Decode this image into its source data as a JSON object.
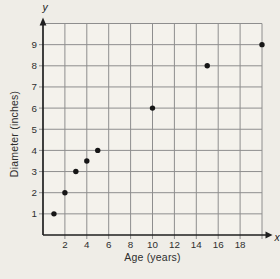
{
  "figure": {
    "background_color": "#efede7",
    "plot_area_color": "#f4f2ec",
    "grid_color": "#8e8e8e",
    "axis_color": "#1f1f1f",
    "point_color": "#161616",
    "text_color": "#2e2e2e"
  },
  "chart_data": {
    "type": "scatter",
    "title": "",
    "xlabel": "Age (years)",
    "ylabel": "Diameter (inches)",
    "x_axis_end_label": "x",
    "y_axis_end_label": "y",
    "xlim": [
      0,
      20
    ],
    "ylim": [
      0,
      10
    ],
    "x_gridline_step": 2,
    "y_gridline_step": 1,
    "grid": true,
    "x_tick_labels": [
      "2",
      "4",
      "6",
      "8",
      "10",
      "12",
      "14",
      "16",
      "18"
    ],
    "x_tick_values": [
      2,
      4,
      6,
      8,
      10,
      12,
      14,
      16,
      18
    ],
    "y_tick_labels": [
      "1",
      "2",
      "3",
      "4",
      "5",
      "6",
      "7",
      "8",
      "9"
    ],
    "y_tick_values": [
      1,
      2,
      3,
      4,
      5,
      6,
      7,
      8,
      9
    ],
    "points": [
      {
        "x": 1,
        "y": 1
      },
      {
        "x": 2,
        "y": 2
      },
      {
        "x": 3,
        "y": 3
      },
      {
        "x": 4,
        "y": 3.5
      },
      {
        "x": 5,
        "y": 4
      },
      {
        "x": 10,
        "y": 6
      },
      {
        "x": 15,
        "y": 8
      },
      {
        "x": 20,
        "y": 9
      }
    ]
  }
}
